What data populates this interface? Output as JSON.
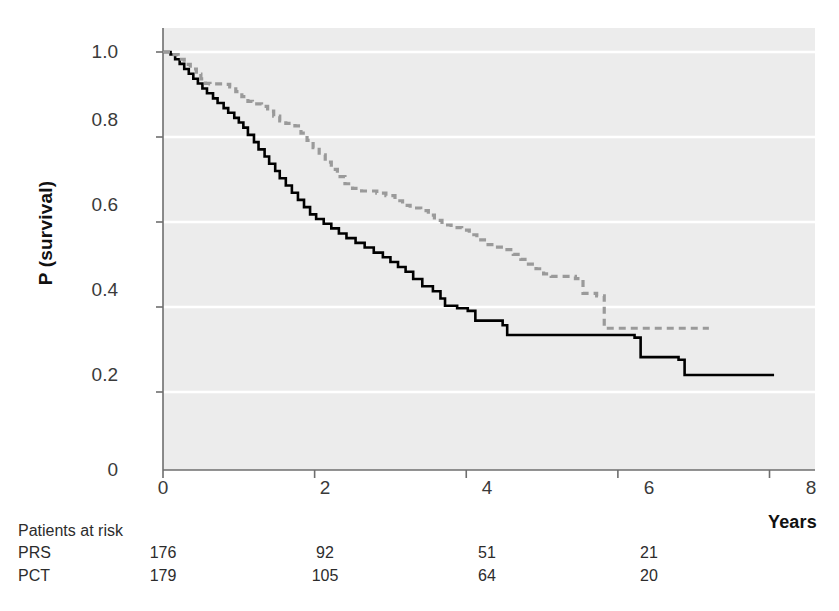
{
  "chart_data": {
    "type": "line",
    "subtype": "kaplan-meier-step",
    "title": "",
    "xlabel": "Years",
    "ylabel": "P (survival)",
    "xlim": [
      0,
      8.6
    ],
    "ylim": [
      0,
      1.05
    ],
    "xticks": [
      0,
      2,
      4,
      6,
      8
    ],
    "xtick_labels": [
      "0",
      "2",
      "4",
      "6",
      "8"
    ],
    "yticks": [
      0.2,
      0.4,
      0.6,
      0.8,
      1.0
    ],
    "ytick_labels": [
      "0.2",
      "0.4",
      "0.6",
      "0.8",
      "1.0"
    ],
    "y_origin_label": "0",
    "grid": "horizontal-white",
    "plot_background": "#ececec",
    "legend_position": "top-right",
    "series": [
      {
        "name": "PRS arm",
        "color": "#000000",
        "style": "solid",
        "points": [
          [
            0.0,
            1.0
          ],
          [
            0.1,
            0.994
          ],
          [
            0.16,
            0.983
          ],
          [
            0.22,
            0.972
          ],
          [
            0.28,
            0.96
          ],
          [
            0.34,
            0.949
          ],
          [
            0.4,
            0.937
          ],
          [
            0.46,
            0.926
          ],
          [
            0.52,
            0.914
          ],
          [
            0.58,
            0.903
          ],
          [
            0.66,
            0.891
          ],
          [
            0.72,
            0.88
          ],
          [
            0.8,
            0.868
          ],
          [
            0.86,
            0.857
          ],
          [
            0.94,
            0.845
          ],
          [
            1.0,
            0.834
          ],
          [
            1.06,
            0.822
          ],
          [
            1.12,
            0.805
          ],
          [
            1.2,
            0.788
          ],
          [
            1.26,
            0.771
          ],
          [
            1.34,
            0.754
          ],
          [
            1.4,
            0.737
          ],
          [
            1.48,
            0.72
          ],
          [
            1.54,
            0.703
          ],
          [
            1.62,
            0.686
          ],
          [
            1.7,
            0.669
          ],
          [
            1.78,
            0.652
          ],
          [
            1.86,
            0.635
          ],
          [
            1.94,
            0.618
          ],
          [
            2.02,
            0.607
          ],
          [
            2.12,
            0.596
          ],
          [
            2.22,
            0.585
          ],
          [
            2.32,
            0.573
          ],
          [
            2.42,
            0.562
          ],
          [
            2.54,
            0.551
          ],
          [
            2.66,
            0.54
          ],
          [
            2.78,
            0.528
          ],
          [
            2.9,
            0.517
          ],
          [
            3.0,
            0.506
          ],
          [
            3.1,
            0.494
          ],
          [
            3.2,
            0.483
          ],
          [
            3.3,
            0.466
          ],
          [
            3.42,
            0.449
          ],
          [
            3.56,
            0.437
          ],
          [
            3.66,
            0.42
          ],
          [
            3.72,
            0.403
          ],
          [
            3.88,
            0.397
          ],
          [
            4.02,
            0.391
          ],
          [
            4.12,
            0.368
          ],
          [
            4.48,
            0.357
          ],
          [
            4.54,
            0.334
          ],
          [
            6.22,
            0.328
          ],
          [
            6.3,
            0.282
          ],
          [
            6.8,
            0.276
          ],
          [
            6.88,
            0.24
          ],
          [
            8.06,
            0.24
          ]
        ]
      },
      {
        "name": "PCT + surgery arm",
        "color": "#9a9a9a",
        "style": "dashed",
        "points": [
          [
            0.0,
            1.0
          ],
          [
            0.12,
            0.994
          ],
          [
            0.2,
            0.983
          ],
          [
            0.28,
            0.971
          ],
          [
            0.36,
            0.96
          ],
          [
            0.44,
            0.948
          ],
          [
            0.5,
            0.937
          ],
          [
            0.56,
            0.926
          ],
          [
            0.62,
            0.925
          ],
          [
            0.8,
            0.924
          ],
          [
            0.88,
            0.918
          ],
          [
            0.96,
            0.907
          ],
          [
            1.04,
            0.895
          ],
          [
            1.12,
            0.884
          ],
          [
            1.18,
            0.878
          ],
          [
            1.3,
            0.872
          ],
          [
            1.38,
            0.861
          ],
          [
            1.46,
            0.849
          ],
          [
            1.54,
            0.838
          ],
          [
            1.62,
            0.832
          ],
          [
            1.74,
            0.826
          ],
          [
            1.82,
            0.809
          ],
          [
            1.9,
            0.792
          ],
          [
            1.98,
            0.775
          ],
          [
            2.06,
            0.758
          ],
          [
            2.14,
            0.741
          ],
          [
            2.22,
            0.724
          ],
          [
            2.3,
            0.707
          ],
          [
            2.4,
            0.69
          ],
          [
            2.5,
            0.679
          ],
          [
            2.62,
            0.673
          ],
          [
            2.82,
            0.668
          ],
          [
            2.94,
            0.662
          ],
          [
            3.06,
            0.65
          ],
          [
            3.16,
            0.639
          ],
          [
            3.26,
            0.633
          ],
          [
            3.4,
            0.627
          ],
          [
            3.5,
            0.616
          ],
          [
            3.58,
            0.604
          ],
          [
            3.68,
            0.593
          ],
          [
            3.8,
            0.587
          ],
          [
            3.94,
            0.581
          ],
          [
            4.04,
            0.57
          ],
          [
            4.14,
            0.558
          ],
          [
            4.24,
            0.547
          ],
          [
            4.36,
            0.541
          ],
          [
            4.5,
            0.535
          ],
          [
            4.62,
            0.524
          ],
          [
            4.72,
            0.512
          ],
          [
            4.82,
            0.501
          ],
          [
            4.92,
            0.49
          ],
          [
            5.02,
            0.478
          ],
          [
            5.12,
            0.472
          ],
          [
            5.44,
            0.467
          ],
          [
            5.54,
            0.432
          ],
          [
            5.72,
            0.426
          ],
          [
            5.82,
            0.35
          ],
          [
            7.2,
            0.35
          ]
        ]
      }
    ]
  },
  "legend": {
    "items": [
      {
        "label": "PRS arm",
        "style": "solid",
        "color": "#000000"
      },
      {
        "label": "PCT + surgery arm",
        "style": "dashed",
        "color": "#9a9a9a"
      }
    ]
  },
  "axis_titles": {
    "y": "P (survival)",
    "x": "Years"
  },
  "risk_table": {
    "caption": "Patients at risk",
    "time_points": [
      0,
      2,
      4,
      6
    ],
    "rows": [
      {
        "label": "PRS",
        "values": [
          "176",
          "92",
          "51",
          "21"
        ]
      },
      {
        "label": "PCT",
        "values": [
          "179",
          "105",
          "64",
          "20"
        ]
      }
    ]
  }
}
